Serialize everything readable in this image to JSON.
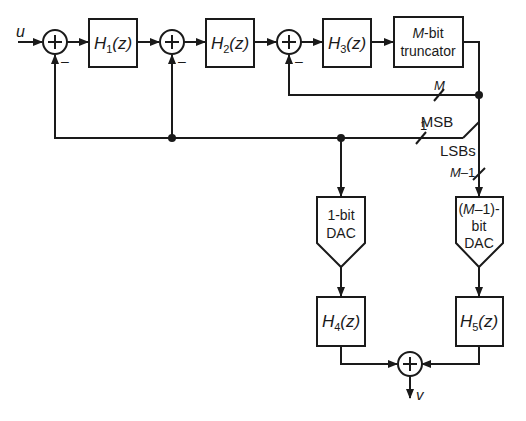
{
  "diagram": {
    "type": "block-diagram",
    "input": "u",
    "output": "v",
    "blocks": [
      {
        "id": "h1",
        "label": "H",
        "sub": "1",
        "arg": "(z)"
      },
      {
        "id": "h2",
        "label": "H",
        "sub": "2",
        "arg": "(z)"
      },
      {
        "id": "h3",
        "label": "H",
        "sub": "3",
        "arg": "(z)"
      },
      {
        "id": "trunc",
        "line1_italic": "M",
        "line1_rest": "-bit",
        "line2": "truncator"
      },
      {
        "id": "dac1",
        "line1": "1-bit",
        "line2": "DAC"
      },
      {
        "id": "dacm",
        "line1_open": "(",
        "line1_italic": "M",
        "line1_rest": "–1)-",
        "line2": "bit",
        "line3": "DAC"
      },
      {
        "id": "h4",
        "label": "H",
        "sub": "4",
        "arg": "(z)"
      },
      {
        "id": "h5",
        "label": "H",
        "sub": "5",
        "arg": "(z)"
      }
    ],
    "summers": [
      {
        "id": "sum1",
        "symbol": "+",
        "feedback_sign": "–"
      },
      {
        "id": "sum2",
        "symbol": "+",
        "feedback_sign": "–"
      },
      {
        "id": "sum3",
        "symbol": "+",
        "feedback_sign": "–"
      },
      {
        "id": "sum_out",
        "symbol": "+"
      }
    ],
    "bus_labels": {
      "m_bus": "M",
      "one_bit": "1",
      "msb": "MSB",
      "lsbs": "LSBs",
      "m_minus_1_italic": "M",
      "m_minus_1_rest": "–1"
    },
    "colors": {
      "stroke": "#1a1a1a",
      "background": "#ffffff"
    }
  }
}
